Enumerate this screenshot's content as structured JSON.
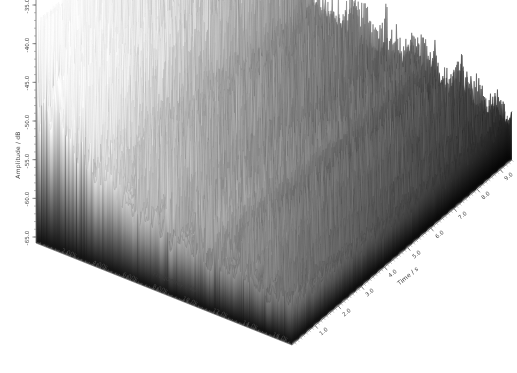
{
  "figure": {
    "type": "3d-waterfall-spectrogram",
    "background_color": "#ffffff",
    "colormap": "grayscale",
    "title": ""
  },
  "axes": {
    "amplitude": {
      "title": "Amplitude / dB",
      "ticks": [
        "-35.0",
        "-40.0",
        "-45.0",
        "-50.0",
        "-55.0",
        "-60.0",
        "-65.0"
      ],
      "min": -65.0,
      "max": -35.0,
      "step": 5.0,
      "unit": "dB"
    },
    "frequency": {
      "title": "Frequency / Hz",
      "ticks": [
        "2.00k",
        "4.00k",
        "6.00k",
        "8.00k",
        "10.0k",
        "12.0k",
        "14.0k",
        "16.0k"
      ],
      "min": 0,
      "max": 17000,
      "step": 2000,
      "unit": "Hz"
    },
    "time": {
      "title": "Time / s",
      "ticks": [
        "1.0",
        "2.0",
        "3.0",
        "4.0",
        "5.0",
        "6.0",
        "7.0",
        "8.0",
        "9.0"
      ],
      "min": 0,
      "max": 9.5,
      "step": 1.0,
      "unit": "s"
    }
  },
  "chart_data": {
    "type": "line",
    "title": "",
    "xlabel": "Frequency / Hz",
    "ylabel": "Amplitude / dB",
    "zlabel": "Time / s",
    "grid": false,
    "legend": null,
    "xlim": [
      0,
      17000
    ],
    "ylim": [
      -65.0,
      -35.0
    ],
    "zlim": [
      0,
      9.5
    ],
    "xtick_labels": [
      "2.00k",
      "4.00k",
      "6.00k",
      "8.00k",
      "10.0k",
      "12.0k",
      "14.0k",
      "16.0k"
    ],
    "ytick_labels": [
      "-35.0",
      "-40.0",
      "-45.0",
      "-50.0",
      "-55.0",
      "-60.0",
      "-65.0"
    ],
    "ztick_labels": [
      "1.0",
      "2.0",
      "3.0",
      "4.0",
      "5.0",
      "6.0",
      "7.0",
      "8.0",
      "9.0"
    ],
    "series_count": 190,
    "points_per_series": 300,
    "ridge_peak_amplitude_db": -35.0,
    "floor_amplitude_db": -65.0,
    "surface_shading": {
      "bright_region": "upper-left (low frequency, early time)",
      "dark_region": "lower-left foreground and right (high time)",
      "min_gray": 0,
      "max_gray": 255
    }
  }
}
